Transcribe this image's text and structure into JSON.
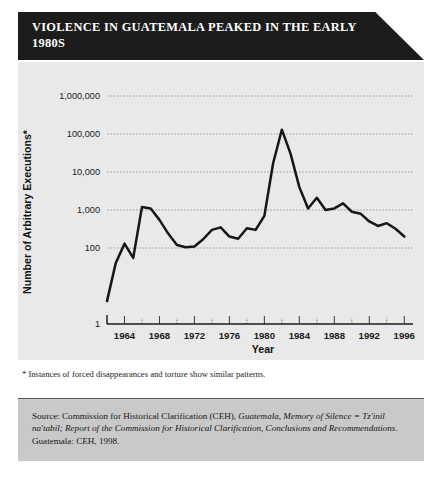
{
  "title": "Violence in Guatemala Peaked in the Early 1980s",
  "footnote": "* Instances of forced disappearances and torture show similar patterns.",
  "source": {
    "prefix": "Source: Commission for Historical Clarification (CEH), ",
    "italic1": "Guatemala, Memory of Silence = Tz'inil na'tabil; Report of the Commission for Historical Clarification, Conclusions and Recommendations",
    "suffix": ". Guatemala: CEH, 1998."
  },
  "colors": {
    "banner_background": "#1c1c1c",
    "banner_text": "#ffffff",
    "panel_background": "#e9e9e9",
    "source_background": "#c9c9c9",
    "line": "#161616",
    "gridline": "#8d8d8d",
    "axis": "#1a1a1a"
  },
  "chart_data": {
    "type": "line",
    "title": "Violence in Guatemala Peaked in the Early 1980s",
    "xlabel": "Year",
    "ylabel": "Number of Arbitrary Executions*",
    "yscale": "log",
    "ylim": [
      1,
      1000000
    ],
    "xlim": [
      1962,
      1997
    ],
    "grid": true,
    "legend": false,
    "ytick_labels": [
      "1",
      "100",
      "1,000",
      "10,000",
      "100,000",
      "1,000,000"
    ],
    "ytick_values": [
      1,
      100,
      1000,
      10000,
      100000,
      1000000
    ],
    "xtick_labels": [
      "1964",
      "1968",
      "1972",
      "1976",
      "1980",
      "1984",
      "1988",
      "1992",
      "1996"
    ],
    "xtick_values": [
      1964,
      1968,
      1972,
      1976,
      1980,
      1984,
      1988,
      1992,
      1996
    ],
    "xminor_step": 2,
    "x": [
      1962,
      1963,
      1964,
      1965,
      1966,
      1967,
      1968,
      1969,
      1970,
      1971,
      1972,
      1973,
      1974,
      1975,
      1976,
      1977,
      1978,
      1979,
      1980,
      1981,
      1982,
      1983,
      1984,
      1985,
      1986,
      1987,
      1988,
      1989,
      1990,
      1991,
      1992,
      1993,
      1994,
      1995,
      1996
    ],
    "values": [
      4,
      40,
      130,
      55,
      1200,
      1100,
      550,
      240,
      120,
      105,
      110,
      170,
      300,
      350,
      200,
      175,
      330,
      300,
      700,
      17000,
      130000,
      30000,
      4000,
      1100,
      2100,
      1000,
      1100,
      1500,
      900,
      800,
      500,
      380,
      450,
      320,
      200
    ],
    "series": [
      {
        "name": "Arbitrary executions",
        "values": [
          4,
          40,
          130,
          55,
          1200,
          1100,
          550,
          240,
          120,
          105,
          110,
          170,
          300,
          350,
          200,
          175,
          330,
          300,
          700,
          17000,
          130000,
          30000,
          4000,
          1100,
          2100,
          1000,
          1100,
          1500,
          900,
          800,
          500,
          380,
          450,
          320,
          200
        ]
      }
    ],
    "annotations": [
      {
        "text": "Peak just above 100,000 executions",
        "year": 1982
      }
    ]
  }
}
